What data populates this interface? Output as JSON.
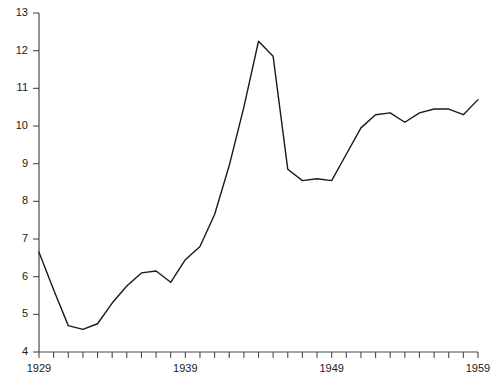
{
  "chart_data": {
    "type": "line",
    "title": "",
    "subtitle": "",
    "xlabel": "",
    "ylabel": "",
    "xlim": [
      1929,
      1959
    ],
    "ylim": [
      4,
      13
    ],
    "grid": false,
    "legend": "none",
    "yticks": [
      4,
      5,
      6,
      7,
      8,
      9,
      10,
      11,
      12,
      13
    ],
    "ytick_labels": [
      "4",
      "5",
      "6",
      "7",
      "8",
      "9",
      "10",
      "11",
      "12",
      "13"
    ],
    "xticks": [
      1929,
      1930,
      1931,
      1932,
      1933,
      1934,
      1935,
      1936,
      1937,
      1938,
      1939,
      1940,
      1941,
      1942,
      1943,
      1944,
      1945,
      1946,
      1947,
      1948,
      1949,
      1950,
      1951,
      1952,
      1953,
      1954,
      1955,
      1956,
      1957,
      1958,
      1959
    ],
    "xtick_labels_shown": [
      "1929",
      "1939",
      "1949",
      "1959"
    ],
    "series": [
      {
        "name": "series-1",
        "color": "#1a1a1a",
        "line_width": 1.4,
        "x": [
          1929,
          1930,
          1931,
          1932,
          1933,
          1934,
          1935,
          1936,
          1937,
          1938,
          1939,
          1940,
          1941,
          1942,
          1943,
          1944,
          1945,
          1946,
          1947,
          1948,
          1949,
          1950,
          1951,
          1952,
          1953,
          1954,
          1955,
          1956,
          1957,
          1958,
          1959
        ],
        "values": [
          6.65,
          5.65,
          4.7,
          4.6,
          4.75,
          5.3,
          5.75,
          6.1,
          6.15,
          5.85,
          6.45,
          6.8,
          7.65,
          8.95,
          10.5,
          12.25,
          11.85,
          8.85,
          8.55,
          8.6,
          8.55,
          9.25,
          9.95,
          10.3,
          10.35,
          10.1,
          10.35,
          10.45,
          10.45,
          10.3,
          10.7
        ]
      }
    ]
  },
  "axis": {
    "y_min_label": "4",
    "y_max_label": "13",
    "x_min_label": "1929",
    "x_max_label": "1959"
  }
}
